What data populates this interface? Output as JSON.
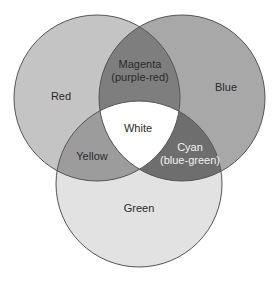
{
  "diagram": {
    "type": "venn",
    "circles": [
      {
        "id": "red",
        "label": "Red",
        "cx": 97,
        "cy": 98,
        "r": 83,
        "fill": "#c4c4c4"
      },
      {
        "id": "blue",
        "label": "Blue",
        "cx": 182,
        "cy": 98,
        "r": 83,
        "fill": "#a8a8a8"
      },
      {
        "id": "green",
        "label": "Green",
        "cx": 139,
        "cy": 184,
        "r": 83,
        "fill": "#e2e2e2"
      }
    ],
    "intersections": {
      "red_blue": {
        "line1": "Magenta",
        "line2": "(purple-red)",
        "fill": "#7e7e7e"
      },
      "red_green": {
        "label": "Yellow",
        "fill": "#9c9c9c"
      },
      "blue_green": {
        "line1": "Cyan",
        "line2": "(blue-green)",
        "fill": "#6e6e6e"
      },
      "red_blue_green": {
        "label": "White",
        "fill": "#ffffff"
      }
    },
    "stroke_color": "#555555"
  }
}
